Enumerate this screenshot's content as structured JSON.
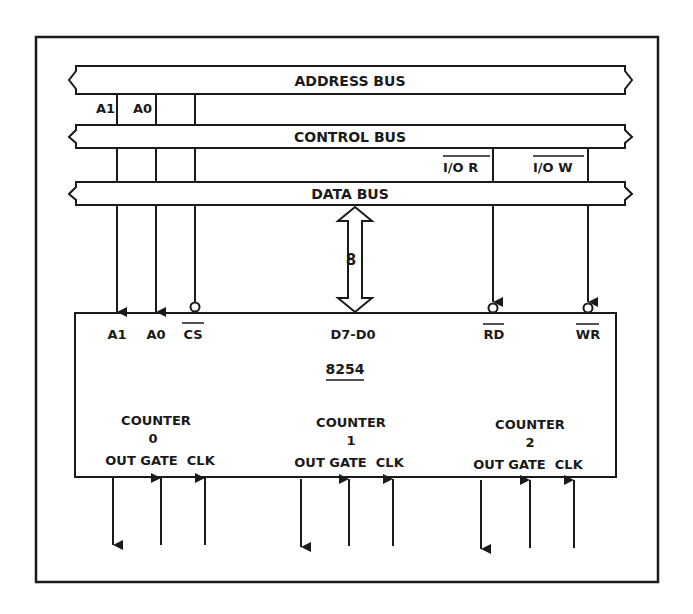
{
  "buses": {
    "address": {
      "label": "ADDRESS BUS"
    },
    "control": {
      "label": "CONTROL BUS"
    },
    "data": {
      "label": "DATA BUS"
    }
  },
  "address_lines": {
    "a1": "A1",
    "a0": "A0"
  },
  "control_lines": {
    "io_read": "I/O R",
    "io_write": "I/O W"
  },
  "data_bus_width": "8",
  "chip": {
    "name": "8254",
    "pins": {
      "a1": "A1",
      "a0": "A0",
      "cs": "CS",
      "data": "D7-D0",
      "rd": "RD",
      "wr": "WR"
    }
  },
  "counters": [
    {
      "title": "COUNTER",
      "number": "0",
      "pins": "OUT GATE  CLK"
    },
    {
      "title": "COUNTER",
      "number": "1",
      "pins": "OUT GATE  CLK"
    },
    {
      "title": "COUNTER",
      "number": "2",
      "pins": "OUT GATE  CLK"
    }
  ]
}
